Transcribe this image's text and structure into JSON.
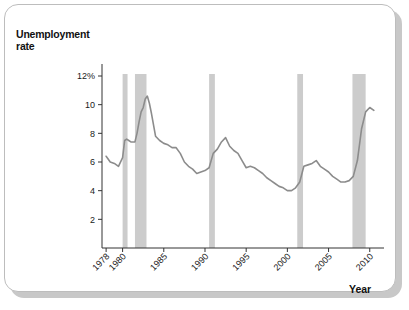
{
  "chart_data": {
    "type": "line",
    "title": "",
    "ylabel": "Unemployment\nrate",
    "ylabel_line1": "Unemployment",
    "ylabel_line2": "rate",
    "xlabel": "Year",
    "ylim": [
      0,
      13
    ],
    "xlim": [
      1977.5,
      2011.0
    ],
    "yticks": [
      2,
      4,
      6,
      8,
      10,
      12
    ],
    "ytick_labels": [
      "2",
      "4",
      "6",
      "8",
      "10",
      "12%"
    ],
    "xticks": [
      1978,
      1980,
      1985,
      1990,
      1995,
      2000,
      2005,
      2010
    ],
    "xtick_labels": [
      "1978",
      "1980",
      "1985",
      "1990",
      "1995",
      "2000",
      "2005",
      "2010"
    ],
    "grid": false,
    "legend": "none",
    "line_color": "#8c8c8c",
    "recession_band_color": "#cccccc",
    "recession_bands": [
      {
        "start": 1980.0,
        "end": 1980.6
      },
      {
        "start": 1981.5,
        "end": 1982.9
      },
      {
        "start": 1990.5,
        "end": 1991.2
      },
      {
        "start": 2001.2,
        "end": 2001.9
      },
      {
        "start": 2007.9,
        "end": 2009.5
      }
    ],
    "x": [
      1978.0,
      1978.5,
      1979.0,
      1979.5,
      1980.0,
      1980.25,
      1980.5,
      1980.75,
      1981.0,
      1981.5,
      1981.75,
      1982.0,
      1982.25,
      1982.5,
      1982.75,
      1983.0,
      1983.25,
      1983.5,
      1984.0,
      1984.5,
      1985.0,
      1985.5,
      1986.0,
      1986.5,
      1987.0,
      1987.5,
      1988.0,
      1988.5,
      1989.0,
      1989.5,
      1990.0,
      1990.5,
      1991.0,
      1991.5,
      1992.0,
      1992.5,
      1993.0,
      1993.5,
      1994.0,
      1994.5,
      1995.0,
      1995.5,
      1996.0,
      1996.5,
      1997.0,
      1997.5,
      1998.0,
      1998.5,
      1999.0,
      1999.5,
      2000.0,
      2000.5,
      2001.0,
      2001.5,
      2002.0,
      2002.5,
      2003.0,
      2003.5,
      2004.0,
      2004.5,
      2005.0,
      2005.5,
      2006.0,
      2006.5,
      2007.0,
      2007.5,
      2008.0,
      2008.5,
      2009.0,
      2009.5,
      2010.0,
      2010.5
    ],
    "y": [
      6.4,
      6.0,
      5.9,
      5.7,
      6.3,
      7.5,
      7.6,
      7.5,
      7.4,
      7.4,
      8.0,
      8.8,
      9.5,
      9.8,
      10.4,
      10.6,
      10.1,
      9.4,
      7.8,
      7.5,
      7.3,
      7.2,
      7.0,
      7.0,
      6.6,
      6.0,
      5.7,
      5.5,
      5.2,
      5.3,
      5.4,
      5.6,
      6.6,
      6.9,
      7.4,
      7.7,
      7.1,
      6.8,
      6.6,
      6.1,
      5.6,
      5.7,
      5.6,
      5.4,
      5.2,
      4.9,
      4.7,
      4.5,
      4.3,
      4.2,
      4.0,
      4.0,
      4.2,
      4.6,
      5.7,
      5.8,
      5.9,
      6.1,
      5.7,
      5.5,
      5.3,
      5.0,
      4.8,
      4.6,
      4.6,
      4.7,
      5.0,
      6.1,
      8.3,
      9.5,
      9.8,
      9.6
    ],
    "peaks": [
      {
        "year": 1983.0,
        "value": 10.6
      },
      {
        "year": 1992.5,
        "value": 7.7
      },
      {
        "year": 2009.8,
        "value": 10.0
      }
    ],
    "troughs": [
      {
        "year": 2000.2,
        "value": 3.9
      },
      {
        "year": 2007.0,
        "value": 4.5
      }
    ]
  }
}
